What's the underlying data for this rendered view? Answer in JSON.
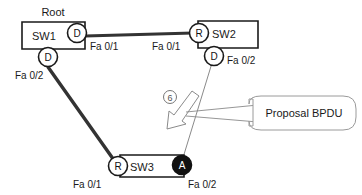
{
  "diagram": {
    "root_label": "Root",
    "colors": {
      "stroke": "#1a1a1a",
      "thick_link": "#333333",
      "thin_link": "#8a8a8a",
      "blocked_fill": "#111111",
      "text": "#1a1a1a",
      "callout_stroke": "#9a9a9a",
      "background": "#ffffff"
    },
    "switches": [
      {
        "id": "sw1",
        "name": "SW1",
        "is_root": true,
        "ports": [
          {
            "role": "D",
            "label": "Fa 0/1",
            "state": "designated"
          },
          {
            "role": "D",
            "label": "Fa 0/2",
            "state": "designated"
          }
        ]
      },
      {
        "id": "sw2",
        "name": "SW2",
        "is_root": false,
        "ports": [
          {
            "role": "R",
            "label": "Fa 0/1",
            "state": "root"
          },
          {
            "role": "D",
            "label": "Fa 0/2",
            "state": "designated"
          }
        ]
      },
      {
        "id": "sw3",
        "name": "SW3",
        "is_root": false,
        "ports": [
          {
            "role": "R",
            "label": "Fa 0/1",
            "state": "root"
          },
          {
            "role": "A",
            "label": "Fa 0/2",
            "state": "alternate"
          }
        ]
      }
    ],
    "links": [
      {
        "id": "sw1-sw2",
        "from": "SW1 Fa 0/1",
        "to": "SW2 Fa 0/1",
        "style": "thick"
      },
      {
        "id": "sw1-sw3",
        "from": "SW1 Fa 0/2",
        "to": "SW3 Fa 0/1",
        "style": "thick"
      },
      {
        "id": "sw2-sw3",
        "from": "SW2 Fa 0/2",
        "to": "SW3 Fa 0/2",
        "style": "thin"
      }
    ],
    "step_markers": [
      {
        "id": "step-6",
        "label": "6"
      }
    ],
    "callout": {
      "text": "Proposal BPDU"
    },
    "port_labels": {
      "sw1_fa01": "Fa 0/1",
      "sw1_fa02": "Fa 0/2",
      "sw2_fa01": "Fa 0/1",
      "sw2_fa02": "Fa 0/2",
      "sw3_fa01": "Fa 0/1",
      "sw3_fa02": "Fa 0/2"
    },
    "role_letters": {
      "sw1_p1": "D",
      "sw1_p2": "D",
      "sw2_p1": "R",
      "sw2_p2": "D",
      "sw3_p1": "R",
      "sw3_p2": "A"
    },
    "switch_names": {
      "sw1": "SW1",
      "sw2": "SW2",
      "sw3": "SW3"
    }
  }
}
